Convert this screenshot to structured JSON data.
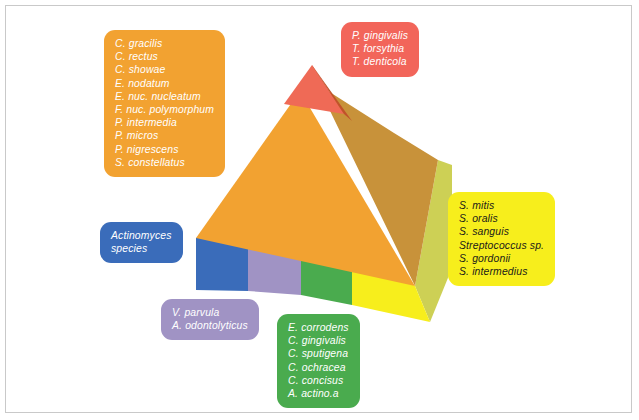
{
  "figure": {
    "background_color": "#ffffff",
    "frame_color": "#c9c9c9"
  },
  "pyramid": {
    "description": "Three-dimensional stepped pyramid with a colored base band of four segments and a tiered body",
    "faces": [
      {
        "name": "apex-front",
        "color": "#ef6a56"
      },
      {
        "name": "apex-right",
        "color": "#c0522a"
      },
      {
        "name": "body-front",
        "color": "#f2a231"
      },
      {
        "name": "body-right",
        "color": "#c8923a"
      },
      {
        "name": "base-right",
        "color": "#cdd055"
      },
      {
        "name": "base-front-blue",
        "color": "#3a6cba"
      },
      {
        "name": "base-front-purple",
        "color": "#a093c4"
      },
      {
        "name": "base-front-green",
        "color": "#4aab4e"
      },
      {
        "name": "base-front-yellow",
        "color": "#f7ee1c"
      }
    ]
  },
  "callouts": [
    {
      "id": "orange",
      "name": "orange-complex-callout",
      "color": "#f2a231",
      "text_color": "#ffffff",
      "species": [
        "C. gracilis",
        "C. rectus",
        "C. showae",
        "E. nodatum",
        "E. nuc. nucleatum",
        "F. nuc. polymorphum",
        "P. intermedia",
        "P. micros",
        "P. nigrescens",
        "S. constellatus"
      ]
    },
    {
      "id": "red",
      "name": "red-complex-callout",
      "color": "#f2655a",
      "text_color": "#ffffff",
      "species": [
        "P. gingivalis",
        "T. forsythia",
        "T. denticola"
      ]
    },
    {
      "id": "yellow",
      "name": "yellow-complex-callout",
      "color": "#f7ee1c",
      "text_color": "#1a1a1a",
      "species": [
        "S. mitis",
        "S. oralis",
        "S. sanguis",
        "Streptococcus sp.",
        "S. gordonii",
        "S. intermedius"
      ]
    },
    {
      "id": "green",
      "name": "green-complex-callout",
      "color": "#4aab4e",
      "text_color": "#ffffff",
      "species": [
        "E. corrodens",
        "C. gingivalis",
        "C. sputigena",
        "C. ochracea",
        "C. concisus",
        "A. actino.a"
      ]
    },
    {
      "id": "purple",
      "name": "purple-complex-callout",
      "color": "#a093c4",
      "text_color": "#ffffff",
      "species": [
        "V. parvula",
        "A. odontolyticus"
      ]
    },
    {
      "id": "blue",
      "name": "blue-complex-callout",
      "color": "#3a6cba",
      "text_color": "#ffffff",
      "species": [
        "Actinomyces",
        "species"
      ]
    }
  ]
}
